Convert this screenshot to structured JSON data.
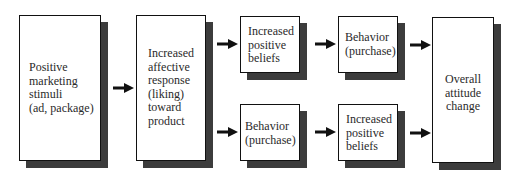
{
  "diagram": {
    "type": "flowchart",
    "nodes": [
      {
        "id": "stimuli",
        "label": "Positive\nmarketing\nstimuli\n(ad, package)"
      },
      {
        "id": "affect",
        "label": "Increased\naffective\nresponse\n(liking)\ntoward\nproduct"
      },
      {
        "id": "beliefs_top",
        "label": "Increased\npositive\nbeliefs"
      },
      {
        "id": "behavior_top",
        "label": "Behavior\n(purchase)"
      },
      {
        "id": "behavior_bottom",
        "label": "Behavior\n(purchase)"
      },
      {
        "id": "beliefs_bottom",
        "label": "Increased\npositive\nbeliefs"
      },
      {
        "id": "attitude",
        "label": "Overall\nattitude\nchange"
      }
    ],
    "edges": [
      {
        "from": "stimuli",
        "to": "affect"
      },
      {
        "from": "affect",
        "to": "beliefs_top"
      },
      {
        "from": "affect",
        "to": "behavior_bottom"
      },
      {
        "from": "beliefs_top",
        "to": "behavior_top"
      },
      {
        "from": "behavior_bottom",
        "to": "beliefs_bottom"
      },
      {
        "from": "behavior_top",
        "to": "attitude"
      },
      {
        "from": "beliefs_bottom",
        "to": "attitude"
      }
    ],
    "colors": {
      "box_fill": "#ffffff",
      "box_border": "#111111",
      "shadow": "#3c3c3c",
      "arrow": "#111111"
    }
  }
}
